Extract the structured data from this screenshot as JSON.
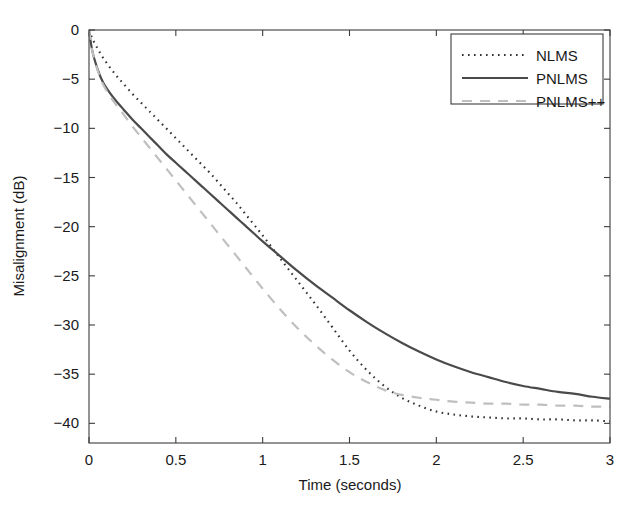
{
  "chart_data": {
    "type": "line",
    "title": "",
    "xlabel": "Time (seconds)",
    "ylabel": "Misalignment (dB)",
    "xlim": [
      0,
      3
    ],
    "ylim": [
      -42,
      0
    ],
    "grid": false,
    "legend_position": "top-right-inside",
    "xticks": [
      0,
      0.5,
      1,
      1.5,
      2,
      2.5,
      3
    ],
    "xticklabels": [
      "0",
      "0.5",
      "1",
      "1.5",
      "2",
      "2.5",
      "3"
    ],
    "yticks": [
      0,
      -5,
      -10,
      -15,
      -20,
      -25,
      -30,
      -35,
      -40
    ],
    "yticklabels": [
      "0",
      "-5",
      "-10",
      "-15",
      "-20",
      "-25",
      "-30",
      "-35",
      "-40"
    ],
    "x": [
      0,
      0.02,
      0.05,
      0.08,
      0.12,
      0.16,
      0.2,
      0.25,
      0.3,
      0.35,
      0.4,
      0.45,
      0.5,
      0.55,
      0.6,
      0.65,
      0.7,
      0.75,
      0.8,
      0.85,
      0.9,
      0.95,
      1.0,
      1.1,
      1.2,
      1.3,
      1.4,
      1.5,
      1.6,
      1.7,
      1.8,
      1.9,
      2.0,
      2.1,
      2.2,
      2.3,
      2.4,
      2.5,
      2.6,
      2.7,
      2.8,
      2.9,
      3.0
    ],
    "series": [
      {
        "name": "NLMS",
        "style": "dotted",
        "color": "#333333",
        "values": [
          0,
          -0.9,
          -1.9,
          -2.8,
          -3.8,
          -4.7,
          -5.5,
          -6.5,
          -7.4,
          -8.3,
          -9.2,
          -10.1,
          -11.0,
          -11.9,
          -12.8,
          -13.7,
          -14.6,
          -15.6,
          -16.6,
          -17.6,
          -18.7,
          -19.8,
          -20.9,
          -23.2,
          -25.5,
          -27.8,
          -30.2,
          -32.6,
          -34.6,
          -36.2,
          -37.4,
          -38.2,
          -38.8,
          -39.1,
          -39.3,
          -39.4,
          -39.5,
          -39.5,
          -39.6,
          -39.6,
          -39.7,
          -39.7,
          -39.8
        ]
      },
      {
        "name": "PNLMS",
        "style": "solid",
        "color": "#4a4a4a",
        "values": [
          0,
          -2.2,
          -4.0,
          -5.3,
          -6.4,
          -7.3,
          -8.1,
          -9.1,
          -10.0,
          -10.9,
          -11.8,
          -12.7,
          -13.5,
          -14.3,
          -15.1,
          -15.9,
          -16.7,
          -17.5,
          -18.3,
          -19.1,
          -19.9,
          -20.7,
          -21.5,
          -23.0,
          -24.5,
          -25.9,
          -27.2,
          -28.5,
          -29.7,
          -30.8,
          -31.8,
          -32.7,
          -33.5,
          -34.2,
          -34.8,
          -35.3,
          -35.8,
          -36.2,
          -36.5,
          -36.8,
          -37.0,
          -37.3,
          -37.5
        ]
      },
      {
        "name": "PNLMS++",
        "style": "dashed",
        "color": "#bfbfbf",
        "values": [
          0,
          -2.2,
          -4.1,
          -5.5,
          -6.7,
          -7.7,
          -8.6,
          -9.8,
          -10.9,
          -12.0,
          -13.1,
          -14.2,
          -15.3,
          -16.4,
          -17.5,
          -18.6,
          -19.7,
          -20.8,
          -21.9,
          -23.0,
          -24.1,
          -25.2,
          -26.3,
          -28.4,
          -30.3,
          -32.0,
          -33.5,
          -34.8,
          -35.8,
          -36.6,
          -37.1,
          -37.4,
          -37.6,
          -37.8,
          -37.9,
          -38.0,
          -38.0,
          -38.1,
          -38.1,
          -38.2,
          -38.2,
          -38.3,
          -38.3
        ]
      }
    ]
  },
  "axes": {
    "xlabel": "Time (seconds)",
    "ylabel": "Misalignment (dB)"
  },
  "legend": {
    "items": [
      {
        "label": "NLMS"
      },
      {
        "label": "PNLMS"
      },
      {
        "label": "PNLMS++"
      }
    ]
  }
}
